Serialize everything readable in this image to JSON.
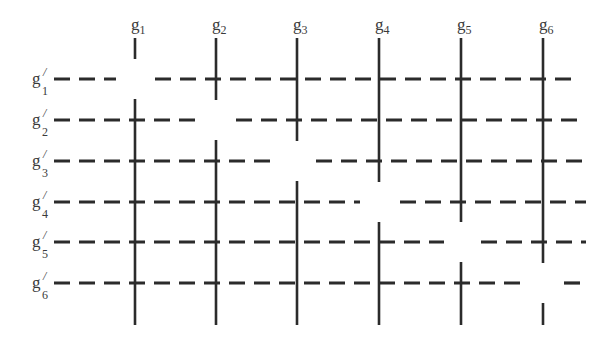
{
  "diagram": {
    "stroke_color": "#2b2b2b",
    "columns": [
      {
        "id": "g1",
        "base": "g",
        "sub": "1",
        "x": 135
      },
      {
        "id": "g2",
        "base": "g",
        "sub": "2",
        "x": 216
      },
      {
        "id": "g3",
        "base": "g",
        "sub": "3",
        "x": 297
      },
      {
        "id": "g4",
        "base": "g",
        "sub": "4",
        "x": 379
      },
      {
        "id": "g5",
        "base": "g",
        "sub": "5",
        "x": 461
      },
      {
        "id": "g6",
        "base": "g",
        "sub": "6",
        "x": 543
      }
    ],
    "rows": [
      {
        "id": "g'1",
        "base": "g",
        "prime": "/",
        "sub": "1",
        "y": 79
      },
      {
        "id": "g'2",
        "base": "g",
        "prime": "/",
        "sub": "2",
        "y": 120
      },
      {
        "id": "g'3",
        "base": "g",
        "prime": "/",
        "sub": "3",
        "y": 161
      },
      {
        "id": "g'4",
        "base": "g",
        "prime": "/",
        "sub": "4",
        "y": 202
      },
      {
        "id": "g'5",
        "base": "g",
        "prime": "/",
        "sub": "5",
        "y": 242
      },
      {
        "id": "g'6",
        "base": "g",
        "prime": "/",
        "sub": "6",
        "y": 283
      }
    ],
    "vertical_segments": [
      {
        "col": "g1",
        "segments": [
          [
            38,
            59
          ],
          [
            99,
            325
          ]
        ]
      },
      {
        "col": "g2",
        "segments": [
          [
            38,
            100
          ],
          [
            140,
            325
          ]
        ]
      },
      {
        "col": "g3",
        "segments": [
          [
            38,
            141
          ],
          [
            181,
            325
          ]
        ]
      },
      {
        "col": "g4",
        "segments": [
          [
            38,
            182
          ],
          [
            222,
            325
          ]
        ]
      },
      {
        "col": "g5",
        "segments": [
          [
            38,
            222
          ],
          [
            262,
            325
          ]
        ]
      },
      {
        "col": "g6",
        "segments": [
          [
            38,
            263
          ],
          [
            303,
            325
          ]
        ]
      }
    ],
    "horizontal_segments": [
      {
        "row": "g'1",
        "segments": [
          [
            54,
            116
          ],
          [
            155,
            578
          ]
        ]
      },
      {
        "row": "g'2",
        "segments": [
          [
            54,
            196
          ],
          [
            236,
            582
          ]
        ]
      },
      {
        "row": "g'3",
        "segments": [
          [
            54,
            270
          ],
          [
            316,
            586
          ]
        ]
      },
      {
        "row": "g'4",
        "segments": [
          [
            54,
            360
          ],
          [
            400,
            586
          ]
        ]
      },
      {
        "row": "g'5",
        "segments": [
          [
            54,
            444
          ],
          [
            481,
            586
          ]
        ]
      },
      {
        "row": "g'6",
        "segments": [
          [
            54,
            524
          ],
          [
            564,
            580
          ]
        ]
      }
    ]
  }
}
